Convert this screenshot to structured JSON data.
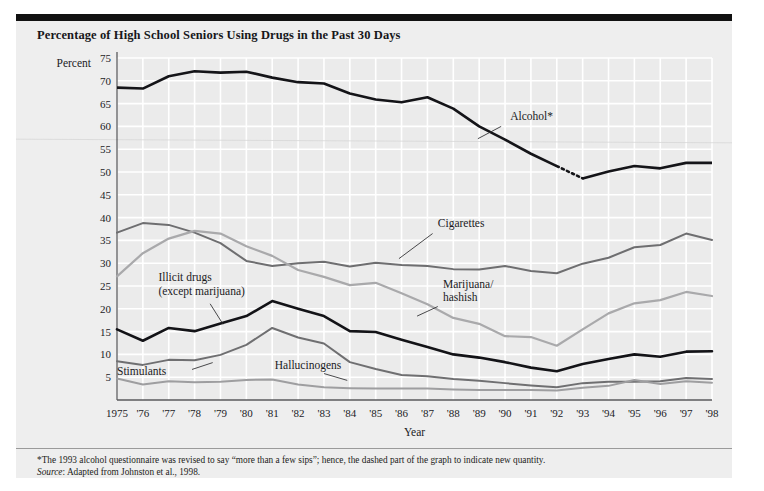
{
  "figure": {
    "title": "Percentage of High School Seniors Using Drugs in the Past 30 Days",
    "footnote": "*The 1993 alcohol questionnaire was revised to say “more than a few sips”; hence, the dashed part of the graph to indicate new quantity.",
    "source_word": "Source",
    "source_text": ": Adapted from Johnston et al., 1998."
  },
  "chart_data": {
    "type": "line",
    "title": "Percentage of High School Seniors Using Drugs in the Past 30 Days",
    "xlabel": "Year",
    "ylabel": "Percent",
    "grid": true,
    "legend_position": "inline-annotations",
    "ylim": [
      0,
      75
    ],
    "yticks": [
      5,
      10,
      15,
      20,
      25,
      30,
      35,
      40,
      45,
      50,
      55,
      60,
      65,
      70,
      75
    ],
    "x": [
      1975,
      1976,
      1977,
      1978,
      1979,
      1980,
      1981,
      1982,
      1983,
      1984,
      1985,
      1986,
      1987,
      1988,
      1989,
      1990,
      1991,
      1992,
      1993,
      1994,
      1995,
      1996,
      1997,
      1998
    ],
    "xticklabels": [
      "1975",
      "'76",
      "'77",
      "'78",
      "'79",
      "'80",
      "'81",
      "'82",
      "'83",
      "'84",
      "'85",
      "'86",
      "'87",
      "'88",
      "'89",
      "'90",
      "'91",
      "'92",
      "'93",
      "'94",
      "'95",
      "'96",
      "'97",
      "'98"
    ],
    "series": [
      {
        "name": "Alcohol*",
        "color": "#141418",
        "width": 2.6,
        "label_x": 1990.2,
        "label_y": 61.5,
        "leader": [
          [
            1989.85,
            60.0
          ],
          [
            1988.95,
            57.3
          ]
        ],
        "dashed_between": [
          1992,
          1993
        ],
        "values": [
          68.5,
          68.3,
          71.0,
          72.1,
          71.8,
          72.0,
          70.7,
          69.7,
          69.4,
          67.2,
          65.9,
          65.3,
          66.4,
          63.9,
          60.0,
          57.1,
          54.0,
          51.3,
          48.6,
          50.1,
          51.3,
          50.8,
          52.0,
          52.0
        ]
      },
      {
        "name": "Cigarettes",
        "color": "#6e6e70",
        "width": 2.0,
        "label_x": 1987.4,
        "label_y": 38.0,
        "leader": [
          [
            1987.2,
            36.5
          ],
          [
            1985.9,
            31.0
          ]
        ],
        "values": [
          36.7,
          38.8,
          38.4,
          36.7,
          34.4,
          30.5,
          29.4,
          30.0,
          30.3,
          29.3,
          30.1,
          29.6,
          29.4,
          28.7,
          28.6,
          29.4,
          28.3,
          27.8,
          29.9,
          31.2,
          33.5,
          34.0,
          36.5,
          35.1
        ]
      },
      {
        "name": "Marijuana/\nhashish",
        "name_lines": [
          "Marijuana/",
          "hashish"
        ],
        "color": "#a9a9ab",
        "width": 2.2,
        "label_x": 1987.6,
        "label_y": 24.6,
        "leader": [
          [
            1987.4,
            20.5
          ],
          [
            1986.6,
            18.4
          ]
        ],
        "values": [
          27.1,
          32.2,
          35.4,
          37.1,
          36.5,
          33.7,
          31.6,
          28.5,
          27.0,
          25.2,
          25.7,
          23.4,
          21.0,
          18.0,
          16.7,
          14.0,
          13.8,
          11.9,
          15.5,
          19.0,
          21.2,
          21.9,
          23.7,
          22.8
        ]
      },
      {
        "name": "Illicit drugs\n(except marijuana)",
        "name_lines": [
          "Illicit drugs",
          "(except marijuana)"
        ],
        "color": "#131317",
        "width": 2.6,
        "label_x": 1976.6,
        "label_y": 26.0,
        "leader": [
          [
            1978.6,
            21.1
          ],
          [
            1979.1,
            16.6
          ]
        ],
        "values": [
          15.5,
          13.0,
          15.8,
          15.1,
          16.8,
          18.4,
          21.7,
          20.0,
          18.4,
          15.1,
          14.9,
          13.2,
          11.6,
          10.0,
          9.3,
          8.3,
          7.1,
          6.3,
          7.9,
          9.0,
          10.0,
          9.5,
          10.6,
          10.7
        ]
      },
      {
        "name": "Stimulants",
        "color": "#6f6f71",
        "width": 2.0,
        "label_x": 1975.0,
        "label_y": 5.4,
        "leader": [
          [
            1977.9,
            6.7
          ],
          [
            1978.7,
            8.2
          ]
        ],
        "values": [
          8.5,
          7.7,
          8.8,
          8.7,
          9.9,
          12.1,
          15.8,
          13.7,
          12.4,
          8.3,
          6.8,
          5.5,
          5.2,
          4.6,
          4.2,
          3.7,
          3.2,
          2.8,
          3.7,
          4.0,
          4.0,
          4.1,
          4.8,
          4.6
        ]
      },
      {
        "name": "Hallucinogens",
        "color": "#9e9ea0",
        "width": 2.0,
        "label_x": 1981.1,
        "label_y": 6.8,
        "leader": [
          [
            1983.0,
            5.8
          ],
          [
            1983.9,
            4.3
          ]
        ],
        "values": [
          4.7,
          3.4,
          4.1,
          3.9,
          4.0,
          4.4,
          4.5,
          3.4,
          2.8,
          2.6,
          2.5,
          2.5,
          2.5,
          2.3,
          2.2,
          2.2,
          2.2,
          2.1,
          2.7,
          3.1,
          4.4,
          3.5,
          4.1,
          3.8
        ]
      }
    ]
  }
}
